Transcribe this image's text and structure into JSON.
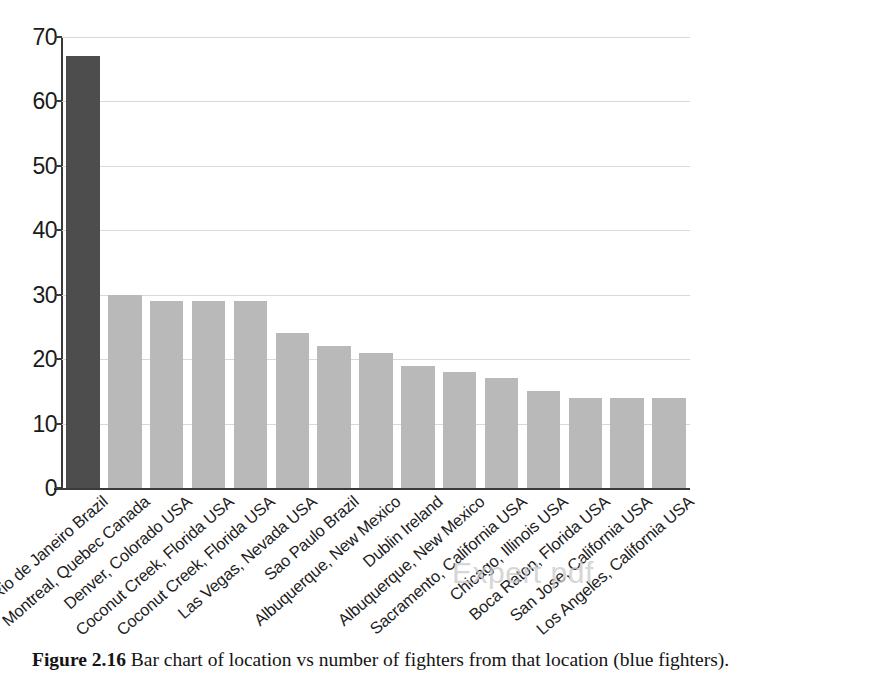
{
  "figure": {
    "label": "Figure 2.16",
    "caption": "Bar chart of location vs number of fighters from that location (blue fighters)."
  },
  "watermark": {
    "text": "Expert pdf"
  },
  "chart_data": {
    "type": "bar",
    "title": "",
    "xlabel": "",
    "ylabel": "",
    "ylim": [
      0,
      70
    ],
    "yticks": [
      0,
      10,
      20,
      30,
      40,
      50,
      60,
      70
    ],
    "grid": true,
    "legend": false,
    "orientation": "vertical",
    "x_tick_rotation": -41,
    "categories": [
      "Rio de Janeiro Brazil",
      "Montreal, Quebec Canada",
      "Denver, Colorado USA",
      "Coconut Creek, Florida USA",
      "Coconut Creek, Florida USA",
      "Las Vegas, Nevada USA",
      "Sao Paulo Brazil",
      "Albuquerque, New Mexico",
      "Dublin Ireland",
      "Albuquerque, New Mexico",
      "Sacramento, California USA",
      "Chicago, Illinois USA",
      "Boca Raton, Florida USA",
      "San Jose, California USA",
      "Los Angeles, California USA"
    ],
    "values": [
      67,
      30,
      29,
      29,
      29,
      24,
      22,
      21,
      19,
      18,
      17,
      15,
      14,
      14,
      14
    ],
    "colors": [
      "#4d4d4d",
      "#b9b9b9",
      "#b9b9b9",
      "#b9b9b9",
      "#b9b9b9",
      "#b9b9b9",
      "#b9b9b9",
      "#b9b9b9",
      "#b9b9b9",
      "#b9b9b9",
      "#b9b9b9",
      "#b9b9b9",
      "#b9b9b9",
      "#b9b9b9",
      "#b9b9b9"
    ],
    "highlight_index": 0,
    "bar_color_default": "#b9b9b9",
    "bar_color_highlight": "#4d4d4d",
    "gridline_color": "#d8d8dd",
    "axis_color": "#3a3a3a"
  }
}
